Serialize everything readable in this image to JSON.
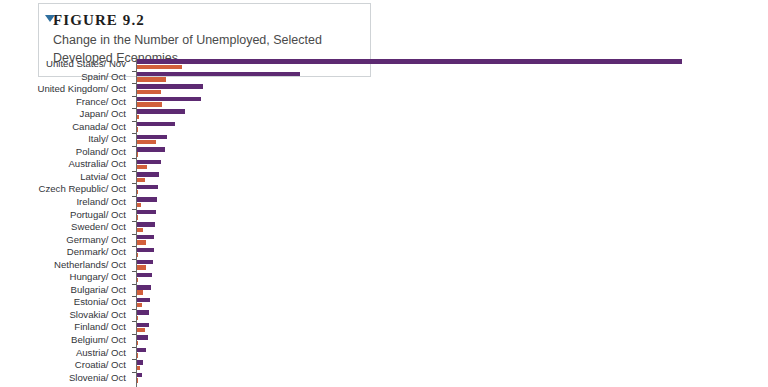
{
  "figure": {
    "marker_icon": "triangle-down-icon",
    "label": "FIGURE 9.2",
    "title": "Change in the Number of Unemployed, Selected Developed Economies"
  },
  "chart_data": {
    "type": "bar",
    "orientation": "horizontal",
    "title": "Change in the Number of Unemployed, Selected Developed Economies",
    "xlabel": "",
    "ylabel": "",
    "grid": false,
    "legend": "none",
    "xlim": [
      0,
      560
    ],
    "colors": {
      "series_a": "#5d2a72",
      "series_b": "#d2603c"
    },
    "categories": [
      "United States/ Nov",
      "Spain/ Oct",
      "United Kingdom/ Oct",
      "France/ Oct",
      "Japan/ Oct",
      "Canada/ Oct",
      "Italy/ Oct",
      "Poland/ Oct",
      "Australia/ Oct",
      "Latvia/ Oct",
      "Czech Republic/ Oct",
      "Ireland/ Oct",
      "Portugal/ Oct",
      "Sweden/ Oct",
      "Germany/ Oct",
      "Denmark/ Oct",
      "Netherlands/ Oct",
      "Hungary/ Oct",
      "Bulgaria/ Oct",
      "Estonia/ Oct",
      "Slovakia/ Oct",
      "Finland/ Oct",
      "Belgium/ Oct",
      "Austria/ Oct",
      "Croatia/ Oct",
      "Slovenia/ Oct"
    ],
    "series": [
      {
        "name": "series-a",
        "color": "#5d2a72",
        "values": [
          552,
          166,
          68,
          66,
          50,
          39,
          31,
          29,
          25,
          23,
          22,
          21,
          20,
          19,
          18,
          18,
          17,
          16,
          15,
          14,
          13,
          13,
          12,
          10,
          7,
          6
        ]
      },
      {
        "name": "series-b",
        "color": "#d2603c",
        "values": [
          46,
          30,
          25,
          26,
          3,
          1,
          20,
          1,
          11,
          9,
          1,
          5,
          1,
          7,
          10,
          2,
          10,
          1,
          7,
          6,
          1,
          9,
          1,
          1,
          4,
          1
        ]
      }
    ]
  }
}
